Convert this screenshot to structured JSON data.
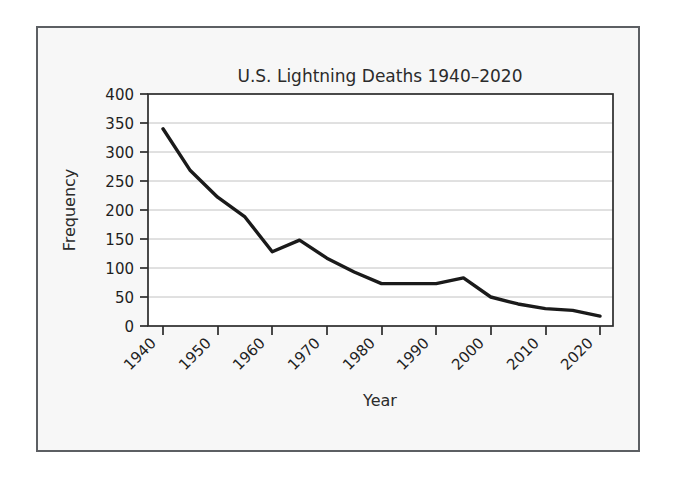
{
  "figure": {
    "background_color": "#f7f7f7",
    "border_color": "#5c5f63",
    "plot_background_color": "#ffffff",
    "grid_color": "#c2c2c2",
    "line_color": "#1a1a1a"
  },
  "chart_data": {
    "type": "line",
    "title": "U.S. Lightning Deaths 1940–2020",
    "xlabel": "Year",
    "ylabel": "Frequency",
    "xlim": [
      1940,
      2020
    ],
    "ylim": [
      0,
      400
    ],
    "grid": "horizontal",
    "legend": "none",
    "x_tick_labels": [
      "1940",
      "1950",
      "1960",
      "1970",
      "1980",
      "1990",
      "2000",
      "2010",
      "2020"
    ],
    "x_ticks": [
      1940,
      1950,
      1960,
      1970,
      1980,
      1990,
      2000,
      2010,
      2020
    ],
    "x_tick_rotation_deg": 45,
    "y_tick_labels": [
      "0",
      "50",
      "100",
      "150",
      "200",
      "250",
      "300",
      "350",
      "400"
    ],
    "y_ticks": [
      0,
      50,
      100,
      150,
      200,
      250,
      300,
      350,
      400
    ],
    "x": [
      1940,
      1945,
      1950,
      1955,
      1960,
      1965,
      1970,
      1975,
      1980,
      1985,
      1990,
      1995,
      2000,
      2005,
      2010,
      2015,
      2020
    ],
    "values": [
      340,
      268,
      222,
      188,
      128,
      148,
      117,
      93,
      73,
      73,
      73,
      83,
      50,
      38,
      30,
      27,
      17
    ],
    "series": [
      {
        "name": "Lightning deaths",
        "values": [
          340,
          268,
          222,
          188,
          128,
          148,
          117,
          93,
          73,
          73,
          73,
          83,
          50,
          38,
          30,
          27,
          17
        ]
      }
    ]
  }
}
